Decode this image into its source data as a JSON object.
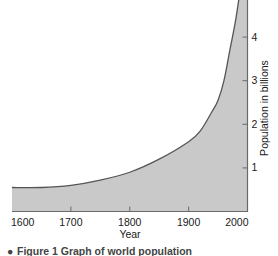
{
  "figure": {
    "caption_bullet": "●",
    "caption": "Figure 1 Graph of world population"
  },
  "colors": {
    "area_fill": "#c9c9c9",
    "curve_line": "#555555",
    "axis_line": "#6a6a6a",
    "text": "#1a1a1a",
    "background": "#ffffff",
    "caption_text": "#444444"
  },
  "chart_data": {
    "type": "area",
    "title": "",
    "subtitle": "",
    "xlabel": "Year",
    "ylabel": "Population in billions",
    "xlim": [
      1600,
      2000
    ],
    "ylim": [
      0,
      5
    ],
    "xticks": [
      1600,
      1700,
      1800,
      1900,
      2000
    ],
    "xtick_labels": [
      "1600",
      "1700",
      "1800",
      "1900",
      "2000"
    ],
    "yticks": [
      1,
      2,
      3,
      4
    ],
    "ytick_labels": [
      "1",
      "2",
      "3",
      "4"
    ],
    "y_axis_position": "right",
    "grid": false,
    "legend": null,
    "x": [
      1600,
      1650,
      1700,
      1750,
      1800,
      1850,
      1900,
      1920,
      1940,
      1950,
      1960,
      1970,
      1980,
      1990,
      2000
    ],
    "values": [
      0.55,
      0.55,
      0.6,
      0.72,
      0.9,
      1.2,
      1.6,
      1.85,
      2.3,
      2.55,
      3.0,
      3.7,
      4.4,
      5.3,
      6.1
    ],
    "series": [
      {
        "name": "World population",
        "values": [
          0.55,
          0.55,
          0.6,
          0.72,
          0.9,
          1.2,
          1.6,
          1.85,
          2.3,
          2.55,
          3.0,
          3.7,
          4.4,
          5.3,
          6.1
        ]
      }
    ]
  }
}
